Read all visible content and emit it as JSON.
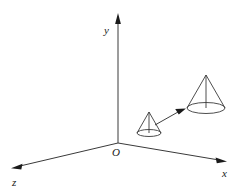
{
  "figure": {
    "background_color": "#ffffff",
    "line_color": "#3a3a3a",
    "label_color": "#1a1a1a",
    "width": 239,
    "height": 191
  },
  "axes": {
    "origin": {
      "label": "O",
      "x": 118,
      "y": 143
    },
    "y_axis": {
      "label": "y",
      "label_x": 106,
      "label_y": 31,
      "from": {
        "x": 118,
        "y": 143
      },
      "to": {
        "x": 118,
        "y": 16
      }
    },
    "x_axis": {
      "label": "x",
      "label_x": 225,
      "label_y": 176,
      "from": {
        "x": 118,
        "y": 143
      },
      "to": {
        "x": 226,
        "y": 161
      }
    },
    "z_axis": {
      "label": "z",
      "label_x": 14,
      "label_y": 184,
      "from": {
        "x": 118,
        "y": 143
      },
      "to": {
        "x": 12,
        "y": 168
      }
    }
  },
  "objects": {
    "small_cone": {
      "name": "small-cone",
      "apex": {
        "x": 149,
        "y": 112
      },
      "base_center": {
        "x": 149,
        "y": 133
      },
      "base_rx": 12,
      "base_ry": 3.5
    },
    "large_cone": {
      "name": "large-cone",
      "apex": {
        "x": 206,
        "y": 75
      },
      "base_center": {
        "x": 206,
        "y": 108
      },
      "base_rx": 19,
      "base_ry": 5.5
    },
    "translation_arrow": {
      "name": "translation-arrow",
      "from": {
        "x": 155,
        "y": 125
      },
      "to": {
        "x": 185,
        "y": 109
      }
    }
  }
}
